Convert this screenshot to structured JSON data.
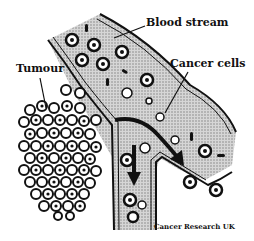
{
  "diagram": {
    "labels": {
      "blood_stream": "Blood stream",
      "cancer_cells": "Cancer cells",
      "tumour": "Tumour"
    },
    "credit": "Cancer Research UK",
    "colors": {
      "ink": "#111111",
      "background": "#ffffff",
      "vessel_fill": "#bdbdbd"
    }
  }
}
